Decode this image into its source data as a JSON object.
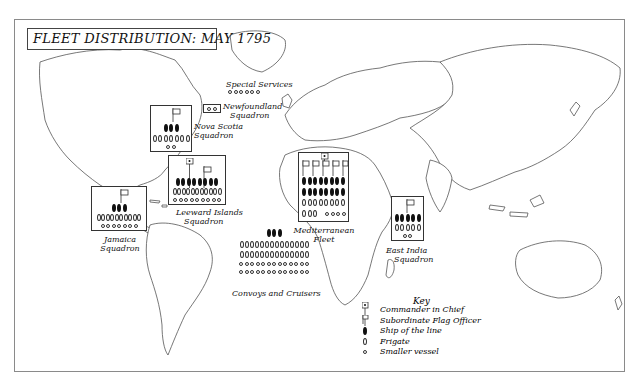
{
  "title": "FLEET DISTRIBUTION: MAY 1795",
  "colors": {
    "ink": "#111111",
    "frame": "#8a8a8a",
    "land": "#ffffff",
    "coast": "#555555"
  },
  "squadrons": [
    {
      "id": "special-services",
      "label": "Special Services",
      "ships_of_line": 0,
      "frigates": 0,
      "smaller": 6,
      "commander_in_chief": false,
      "subordinate_flags": 0
    },
    {
      "id": "newfoundland",
      "label": "Newfoundland Squadron",
      "ships_of_line": 0,
      "frigates": 0,
      "smaller": 2,
      "commander_in_chief": false,
      "subordinate_flags": 0
    },
    {
      "id": "nova-scotia",
      "label": "Nova Scotia Squadron",
      "ships_of_line": 3,
      "frigates": 7,
      "smaller": 2,
      "commander_in_chief": false,
      "subordinate_flags": 1
    },
    {
      "id": "jamaica",
      "label": "Jamaica Squadron",
      "ships_of_line": 3,
      "frigates": 10,
      "smaller": 7,
      "commander_in_chief": false,
      "subordinate_flags": 1
    },
    {
      "id": "leeward-islands",
      "label": "Leeward Islands Squadron",
      "ships_of_line": 8,
      "frigates": 11,
      "smaller": 9,
      "commander_in_chief": true,
      "subordinate_flags": 2
    },
    {
      "id": "mediterranean",
      "label": "Mediterranean Fleet",
      "ships_of_line": 16,
      "frigates": 11,
      "smaller": 4,
      "commander_in_chief": true,
      "subordinate_flags": 5
    },
    {
      "id": "east-india",
      "label": "East India Squadron",
      "ships_of_line": 5,
      "frigates": 5,
      "smaller": 2,
      "commander_in_chief": false,
      "subordinate_flags": 1
    },
    {
      "id": "convoys",
      "label": "Convoys and Cruisers",
      "ships_of_line": 3,
      "frigates": 28,
      "smaller": 26,
      "commander_in_chief": false,
      "subordinate_flags": 0
    }
  ],
  "labels": {
    "special_services": "Special Services",
    "newfoundland_1": "Newfoundland",
    "newfoundland_2": "Squadron",
    "nova_scotia_1": "Nova Scotia",
    "nova_scotia_2": "Squadron",
    "jamaica_1": "Jamaica",
    "jamaica_2": "Squadron",
    "leeward_1": "Leeward Islands",
    "leeward_2": "Squadron",
    "mediterranean_1": "Mediterranean",
    "mediterranean_2": "Fleet",
    "east_india_1": "East India",
    "east_india_2": "Squadron",
    "convoys": "Convoys and Cruisers"
  },
  "key": {
    "title": "Key",
    "items": [
      {
        "symbol": "commander-in-chief-flag",
        "label": "Commander in Chief"
      },
      {
        "symbol": "subordinate-flag",
        "label": "Subordinate Flag Officer"
      },
      {
        "symbol": "ship-of-line",
        "label": "Ship of the line"
      },
      {
        "symbol": "frigate",
        "label": "Frigate"
      },
      {
        "symbol": "smaller-vessel",
        "label": "Smaller vessel"
      }
    ]
  }
}
